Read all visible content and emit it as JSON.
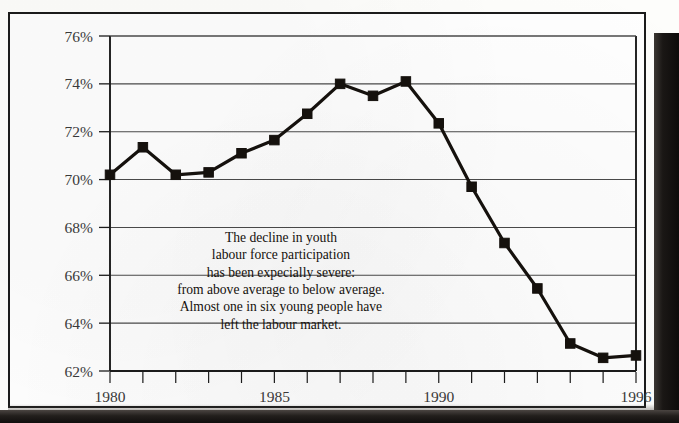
{
  "figure": {
    "annotation_lines": [
      "The decline in youth",
      "labour force participation",
      "has been expecially severe:",
      "from above average to below average.",
      "Almost one in six young people have",
      "left the labour market."
    ],
    "colors": {
      "ink": "#15110d",
      "gridline": "#4a4a4a",
      "axis": "#1b1b1b",
      "paper": "#fdfdfb",
      "tick_label": "#3a3a3a"
    }
  },
  "chart_data": {
    "type": "line",
    "title": "",
    "xlabel": "",
    "ylabel": "",
    "x": [
      1980,
      1981,
      1982,
      1983,
      1984,
      1985,
      1986,
      1987,
      1988,
      1989,
      1990,
      1991,
      1992,
      1993,
      1994,
      1995,
      1996
    ],
    "values": [
      70.2,
      71.35,
      70.2,
      70.3,
      71.1,
      71.65,
      72.75,
      74.0,
      73.5,
      74.1,
      72.35,
      69.7,
      67.35,
      65.45,
      63.15,
      62.55,
      62.65
    ],
    "series": [
      {
        "name": "Youth labour force participation rate",
        "values": [
          70.2,
          71.35,
          70.2,
          70.3,
          71.1,
          71.65,
          72.75,
          74.0,
          73.5,
          74.1,
          72.35,
          69.7,
          67.35,
          65.45,
          63.15,
          62.55,
          62.65
        ]
      }
    ],
    "xlim": [
      1980,
      1996
    ],
    "ylim": [
      62,
      76
    ],
    "ytick_labels": [
      "76%",
      "74%",
      "72%",
      "70%",
      "68%",
      "66%",
      "64%",
      "62%"
    ],
    "ytick_values": [
      76,
      74,
      72,
      70,
      68,
      66,
      64,
      62
    ],
    "xtick_labels": [
      "1980",
      "1985",
      "1990",
      "1996"
    ],
    "xtick_values": [
      1980,
      1985,
      1990,
      1996
    ],
    "xtick_minor_values": [
      1980,
      1981,
      1982,
      1983,
      1984,
      1985,
      1986,
      1987,
      1988,
      1989,
      1990,
      1991,
      1992,
      1993,
      1994,
      1995,
      1996
    ],
    "grid": true,
    "grid_axis": "y",
    "legend": false,
    "marker": "square",
    "line_color": "#15110d",
    "marker_color": "#15110d",
    "annotation": {
      "text": "The decline in youth labour force participation has been expecially severe: from above average to below average. Almost one in six young people have left the labour market.",
      "x": 1985.2,
      "y": 67.4
    }
  }
}
